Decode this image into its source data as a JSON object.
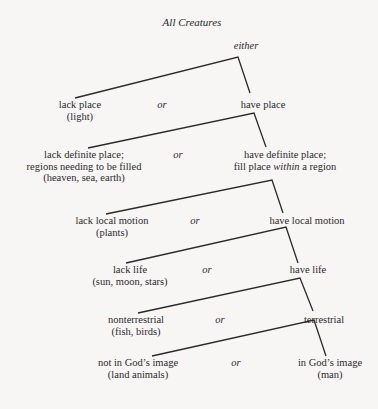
{
  "title": "All Creatures",
  "root_label": "either",
  "connector": "or",
  "levels": [
    {
      "left": [
        "lack place",
        "(light)"
      ],
      "right": [
        "have place"
      ]
    },
    {
      "left": [
        "lack definite place;",
        "regions needing to be filled",
        "(heaven, sea, earth)"
      ],
      "right": [
        "have definite place;",
        "fill place ",
        "within",
        " a region"
      ]
    },
    {
      "left": [
        "lack local motion",
        "(plants)"
      ],
      "right": [
        "have local motion"
      ]
    },
    {
      "left": [
        "lack life",
        "(sun, moon, stars)"
      ],
      "right": [
        "have life"
      ]
    },
    {
      "left": [
        "nonterrestrial",
        "(fish, birds)"
      ],
      "right": [
        "terrestrial"
      ]
    },
    {
      "left": [
        "not in God’s image",
        "(land animals)"
      ],
      "right": [
        "in God’s image",
        "(man)"
      ]
    }
  ],
  "colors": {
    "background": "#f7f6f4",
    "ink": "#2a2a2a"
  }
}
